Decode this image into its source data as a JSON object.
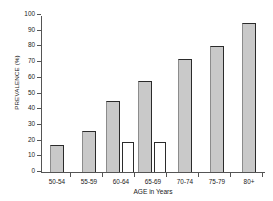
{
  "chart_data": {
    "type": "bar",
    "title": "",
    "xlabel": "AGE in Years",
    "ylabel": "PREVALENCE (%)",
    "categories": [
      "50-54",
      "55-59",
      "60-64",
      "65-69",
      "70-74",
      "75-79",
      "80+"
    ],
    "series": [
      {
        "name": "shaded",
        "style": "filled",
        "values": [
          17,
          26,
          45,
          58,
          72,
          80,
          95
        ]
      },
      {
        "name": "open",
        "style": "hollow",
        "values": [
          null,
          null,
          19,
          19,
          null,
          null,
          null
        ]
      }
    ],
    "ylim": [
      0,
      100
    ],
    "yticks": [
      0,
      10,
      20,
      30,
      40,
      50,
      60,
      70,
      80,
      90,
      100
    ],
    "ytick_labels": [
      "0",
      "10",
      "20",
      "30",
      "40",
      "50",
      "60",
      "70",
      "80",
      "90",
      "100"
    ],
    "grid": false,
    "legend": "none"
  },
  "colors": {
    "bar_fill": "#c9c9c9",
    "bar_edge": "#2b2b2b",
    "axis": "#555555",
    "text": "#1a1a1a",
    "background": "#ffffff"
  }
}
